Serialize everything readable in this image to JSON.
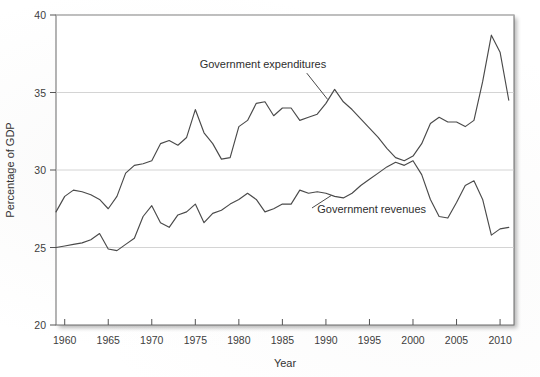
{
  "chart_data": {
    "type": "line",
    "title": "",
    "xlabel": "Year",
    "ylabel": "Percentage of GDP",
    "xlim": [
      1959,
      2011.6
    ],
    "ylim": [
      20,
      40
    ],
    "xticks": [
      1960,
      1965,
      1970,
      1975,
      1980,
      1985,
      1990,
      1995,
      2000,
      2005,
      2010
    ],
    "xtick_labels": [
      "1960",
      "1965",
      "1970",
      "1975",
      "1980",
      "1985",
      "1990",
      "1995",
      "2000",
      "2005",
      "2010"
    ],
    "yticks": [
      20,
      25,
      30,
      35,
      40
    ],
    "ytick_labels": [
      "20",
      "25",
      "30",
      "35",
      "40"
    ],
    "grid": "horizontal",
    "legend_position": "inline-annotations",
    "line_color": "#4a4a4a",
    "grid_color": "#c9c9c9",
    "axis_color": "#555555",
    "annotations": [
      {
        "name": "expenditures-label",
        "text": "Government expenditures",
        "x": 1975.5,
        "y": 36.6
      },
      {
        "name": "revenues-label",
        "text": "Government revenues",
        "x": 1989.0,
        "y": 27.2
      }
    ],
    "series": [
      {
        "name": "Government expenditures",
        "x": [
          1959,
          1960,
          1961,
          1962,
          1963,
          1964,
          1965,
          1966,
          1967,
          1968,
          1969,
          1970,
          1971,
          1972,
          1973,
          1974,
          1975,
          1976,
          1977,
          1978,
          1979,
          1980,
          1981,
          1982,
          1983,
          1984,
          1985,
          1986,
          1987,
          1988,
          1989,
          1990,
          1991,
          1992,
          1993,
          1994,
          1995,
          1996,
          1997,
          1998,
          1999,
          2000,
          2001,
          2002,
          2003,
          2004,
          2005,
          2006,
          2007,
          2008,
          2009,
          2010,
          2011
        ],
        "values": [
          27.3,
          28.3,
          28.7,
          28.6,
          28.4,
          28.1,
          27.5,
          28.3,
          29.8,
          30.3,
          30.4,
          30.6,
          31.7,
          31.9,
          31.6,
          32.1,
          33.9,
          32.4,
          31.7,
          30.7,
          30.8,
          32.8,
          33.2,
          34.3,
          34.4,
          33.5,
          34.0,
          34.0,
          33.2,
          33.4,
          33.6,
          34.3,
          35.2,
          34.4,
          33.9,
          33.3,
          32.7,
          32.1,
          31.4,
          30.8,
          30.6,
          30.9,
          31.7,
          33.0,
          33.4,
          33.1,
          33.1,
          32.8,
          33.2,
          35.7,
          38.7,
          37.6,
          34.5
        ]
      },
      {
        "name": "Government revenues",
        "x": [
          1959,
          1960,
          1961,
          1962,
          1963,
          1964,
          1965,
          1966,
          1967,
          1968,
          1969,
          1970,
          1971,
          1972,
          1973,
          1974,
          1975,
          1976,
          1977,
          1978,
          1979,
          1980,
          1981,
          1982,
          1983,
          1984,
          1985,
          1986,
          1987,
          1988,
          1989,
          1990,
          1991,
          1992,
          1993,
          1994,
          1995,
          1996,
          1997,
          1998,
          1999,
          2000,
          2001,
          2002,
          2003,
          2004,
          2005,
          2006,
          2007,
          2008,
          2009,
          2010,
          2011
        ],
        "values": [
          25.0,
          25.1,
          25.2,
          25.3,
          25.5,
          25.9,
          24.9,
          24.8,
          25.2,
          25.6,
          27.0,
          27.7,
          26.6,
          26.3,
          27.1,
          27.3,
          27.8,
          26.6,
          27.2,
          27.4,
          27.8,
          28.1,
          28.5,
          28.1,
          27.3,
          27.5,
          27.8,
          27.8,
          28.7,
          28.5,
          28.6,
          28.5,
          28.3,
          28.2,
          28.5,
          29.0,
          29.4,
          29.8,
          30.2,
          30.5,
          30.3,
          30.6,
          29.7,
          28.1,
          27.0,
          26.9,
          27.9,
          29.0,
          29.3,
          28.1,
          25.8,
          26.2,
          26.3
        ]
      }
    ]
  }
}
